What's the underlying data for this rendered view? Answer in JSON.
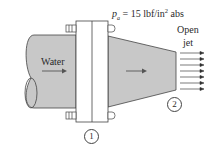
{
  "diagram": {
    "pressure_label": {
      "symbol": "p",
      "subscript": "a",
      "text": " = 15 lbf/in",
      "sup": "2",
      "suffix": " abs"
    },
    "fluid_label": "Water",
    "jet_label": {
      "line1": "Open",
      "line2": "jet"
    },
    "sections": [
      "1",
      "2"
    ],
    "colors": {
      "fluid_fill": "#c8c8c8",
      "outline": "#444444",
      "background": "#ffffff"
    },
    "jet_arrow_count": 7
  }
}
